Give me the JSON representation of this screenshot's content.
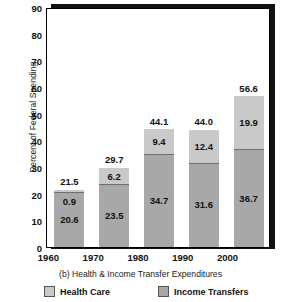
{
  "chart_data": {
    "type": "bar",
    "stacked": true,
    "title": "",
    "caption": "(b) Health & Income Transfer Expenditures",
    "xlabel": "",
    "ylabel": "Percent of Federal Spending",
    "categories": [
      "1960",
      "1970",
      "1980",
      "1990",
      "2000"
    ],
    "ylim": [
      0,
      90
    ],
    "yticks": [
      0,
      10,
      20,
      30,
      40,
      50,
      60,
      70,
      80,
      90
    ],
    "ytick_labels": [
      "0",
      "10",
      "20",
      "30",
      "40",
      "50",
      "60",
      "70",
      "80",
      "90"
    ],
    "grid": false,
    "legend_position": "bottom",
    "series": [
      {
        "name": "Income Transfers",
        "color": "#a8a8a8",
        "values": [
          20.6,
          23.5,
          34.7,
          31.6,
          36.7
        ],
        "labels": [
          "20.6",
          "23.5",
          "34.7",
          "31.6",
          "36.7"
        ]
      },
      {
        "name": "Health Care",
        "color": "#c9c9c9",
        "values": [
          0.9,
          6.2,
          9.4,
          12.4,
          19.9
        ],
        "labels": [
          "0.9",
          "6.2",
          "9.4",
          "12.4",
          "19.9"
        ]
      }
    ],
    "totals": [
      21.5,
      29.7,
      44.1,
      44.0,
      56.6
    ],
    "total_labels": [
      "21.5",
      "29.7",
      "44.1",
      "44.0",
      "56.6"
    ]
  },
  "legend": {
    "items": [
      {
        "label": "Health Care",
        "color": "#c9c9c9"
      },
      {
        "label": "Income Transfers",
        "color": "#a8a8a8"
      }
    ]
  }
}
